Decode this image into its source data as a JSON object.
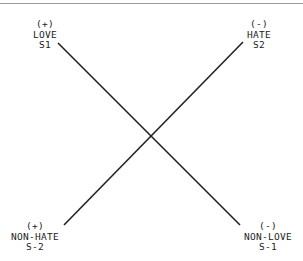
{
  "diagram": {
    "type": "semiotic-square",
    "line_color": "#222222",
    "rule_color": "#9a9a9a",
    "corners": {
      "top_left": {
        "sign": "(+)",
        "term": "LOVE",
        "code": "S1"
      },
      "top_right": {
        "sign": "(-)",
        "term": "HATE",
        "code": "S2"
      },
      "bottom_left": {
        "sign": "(+)",
        "term": "NON-HATE",
        "code": "S-2"
      },
      "bottom_right": {
        "sign": "(-)",
        "term": "NON-LOVE",
        "code": "S-1"
      }
    },
    "edges": [
      {
        "from": "LOVE S1",
        "to": "NON-LOVE S-1"
      },
      {
        "from": "NON-HATE S-2",
        "to": "HATE S2"
      }
    ]
  }
}
